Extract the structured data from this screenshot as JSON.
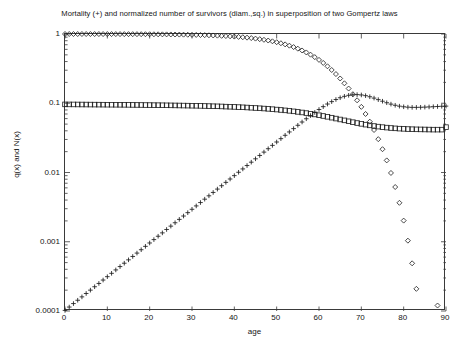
{
  "chart_data": {
    "type": "scatter",
    "title": "Mortality (+) and normalized number of survivors (diam.,sq.) in superposition of two Gompertz laws",
    "xlabel": "age",
    "ylabel": "q(x) and N(x)",
    "xlim": [
      0,
      90
    ],
    "ylim": [
      0.0001,
      1
    ],
    "yscale": "log",
    "xscale": "linear",
    "grid": false,
    "legend": "none",
    "xticks": [
      0,
      10,
      20,
      30,
      40,
      50,
      60,
      70,
      80,
      90
    ],
    "xtick_labels": [
      "0",
      "10",
      "20",
      "30",
      "40",
      "50",
      "60",
      "70",
      "80",
      "90"
    ],
    "yticks": [
      1,
      0.1,
      0.01,
      0.001,
      0.0001
    ],
    "ytick_labels": [
      "1",
      "0.1",
      "0.01",
      "0.001",
      "0.0001"
    ],
    "marker_color": "#1c1c1c",
    "frame_color": "#3a3a3a",
    "background": "#ffffff",
    "series": [
      {
        "name": "Mortality q(x)",
        "marker": "+",
        "marker_label": "plus",
        "x": [
          0,
          1,
          2,
          3,
          4,
          5,
          6,
          7,
          8,
          9,
          10,
          11,
          12,
          13,
          14,
          15,
          16,
          17,
          18,
          19,
          20,
          21,
          22,
          23,
          24,
          25,
          26,
          27,
          28,
          29,
          30,
          31,
          32,
          33,
          34,
          35,
          36,
          37,
          38,
          39,
          40,
          41,
          42,
          43,
          44,
          45,
          46,
          47,
          48,
          49,
          50,
          51,
          52,
          53,
          54,
          55,
          56,
          57,
          58,
          59,
          60,
          61,
          62,
          63,
          64,
          65,
          66,
          67,
          68,
          69,
          70,
          71,
          72,
          73,
          74,
          75,
          76,
          77,
          78,
          79,
          80,
          81,
          82,
          83,
          84,
          85,
          86,
          87,
          88,
          89,
          90
        ],
        "y": [
          0.000102,
          0.000114,
          0.000128,
          0.000143,
          0.00016,
          0.000179,
          0.0002,
          0.000224,
          0.00025,
          0.00028,
          0.000313,
          0.00035,
          0.000392,
          0.000438,
          0.00049,
          0.000548,
          0.000613,
          0.000686,
          0.000767,
          0.000858,
          0.00096,
          0.001074,
          0.001201,
          0.001343,
          0.001503,
          0.001681,
          0.00188,
          0.002103,
          0.002352,
          0.002631,
          0.002943,
          0.003292,
          0.003682,
          0.004118,
          0.004606,
          0.005151,
          0.00576,
          0.006442,
          0.007204,
          0.008057,
          0.009011,
          0.010077,
          0.011269,
          0.012602,
          0.014093,
          0.01576,
          0.017624,
          0.019709,
          0.02204,
          0.024646,
          0.02756,
          0.030816,
          0.034452,
          0.038509,
          0.043028,
          0.048049,
          0.053607,
          0.059722,
          0.066398,
          0.073604,
          0.08127,
          0.089276,
          0.097439,
          0.105513,
          0.113188,
          0.120103,
          0.125879,
          0.13016,
          0.132662,
          0.13322,
          0.131834,
          0.128686,
          0.124135,
          0.118664,
          0.112795,
          0.107016,
          0.101718,
          0.097169,
          0.093508,
          0.090768,
          0.088887,
          0.087756,
          0.087228,
          0.087159,
          0.087414,
          0.087882,
          0.088471,
          0.089115,
          0.089762,
          0.090378,
          0.09094
        ]
      },
      {
        "name": "Normalized survivors N(x) (diamonds)",
        "marker": "diamond",
        "marker_label": "diamond",
        "x": [
          0,
          1,
          2,
          3,
          4,
          5,
          6,
          7,
          8,
          9,
          10,
          11,
          12,
          13,
          14,
          15,
          16,
          17,
          18,
          19,
          20,
          21,
          22,
          23,
          24,
          25,
          26,
          27,
          28,
          29,
          30,
          31,
          32,
          33,
          34,
          35,
          36,
          37,
          38,
          39,
          40,
          41,
          42,
          43,
          44,
          45,
          46,
          47,
          48,
          49,
          50,
          51,
          52,
          53,
          54,
          55,
          56,
          57,
          58,
          59,
          60,
          61,
          62,
          63,
          64,
          65,
          66,
          67,
          68,
          69,
          70,
          71,
          72,
          73,
          74,
          75,
          76,
          77,
          78,
          79,
          80,
          81,
          82,
          83,
          84,
          85,
          86,
          87,
          88
        ],
        "y": [
          1.0,
          0.9999,
          0.9998,
          0.9996,
          0.9995,
          0.9993,
          0.9991,
          0.9989,
          0.9986,
          0.9983,
          0.998,
          0.9977,
          0.9973,
          0.9968,
          0.9963,
          0.9957,
          0.9951,
          0.9944,
          0.9936,
          0.9928,
          0.9918,
          0.9907,
          0.9895,
          0.9882,
          0.9867,
          0.985,
          0.9831,
          0.981,
          0.9787,
          0.9761,
          0.9732,
          0.9699,
          0.9663,
          0.9623,
          0.9578,
          0.9528,
          0.9472,
          0.941,
          0.9341,
          0.9264,
          0.9178,
          0.9083,
          0.8977,
          0.8859,
          0.8728,
          0.8583,
          0.8423,
          0.8246,
          0.8052,
          0.7839,
          0.7607,
          0.7355,
          0.7082,
          0.6788,
          0.6474,
          0.6139,
          0.5786,
          0.5415,
          0.503,
          0.4633,
          0.4228,
          0.3821,
          0.3417,
          0.3021,
          0.264,
          0.2278,
          0.1941,
          0.1631,
          0.1351,
          0.1103,
          0.0887,
          0.07,
          0.0542,
          0.0411,
          0.0303,
          0.0217,
          0.01495,
          0.00985,
          0.00617,
          0.00365,
          0.00202,
          0.001037,
          0.000488,
          0.000209,
          8.06e-05,
          2.79e-05,
          8.6e-06,
          2.4e-06,
          0.00012
        ]
      },
      {
        "name": "Normalized survivors N(x) (squares)",
        "marker": "square",
        "marker_label": "square",
        "x": [
          0,
          1,
          2,
          3,
          4,
          5,
          6,
          7,
          8,
          9,
          10,
          11,
          12,
          13,
          14,
          15,
          16,
          17,
          18,
          19,
          20,
          21,
          22,
          23,
          24,
          25,
          26,
          27,
          28,
          29,
          30,
          31,
          32,
          33,
          34,
          35,
          36,
          37,
          38,
          39,
          40,
          41,
          42,
          43,
          44,
          45,
          46,
          47,
          48,
          49,
          50,
          51,
          52,
          53,
          54,
          55,
          56,
          57,
          58,
          59,
          60,
          61,
          62,
          63,
          64,
          65,
          66,
          67,
          68,
          69,
          70,
          71,
          72,
          73,
          74,
          75,
          76,
          77,
          78,
          79,
          80,
          81,
          82,
          83,
          84,
          85,
          86,
          87,
          88,
          89,
          90
        ],
        "y": [
          0.0963,
          0.0962,
          0.0961,
          0.096,
          0.0959,
          0.0958,
          0.0957,
          0.0956,
          0.0955,
          0.0954,
          0.0953,
          0.0952,
          0.0951,
          0.095,
          0.0949,
          0.0948,
          0.0946,
          0.0945,
          0.0944,
          0.0942,
          0.0941,
          0.0939,
          0.0938,
          0.0936,
          0.0934,
          0.0932,
          0.093,
          0.0928,
          0.0926,
          0.0924,
          0.0921,
          0.0919,
          0.0916,
          0.0913,
          0.091,
          0.0906,
          0.0903,
          0.0899,
          0.0894,
          0.089,
          0.0885,
          0.088,
          0.0874,
          0.0868,
          0.0861,
          0.0854,
          0.0847,
          0.0839,
          0.083,
          0.0821,
          0.0811,
          0.08,
          0.0789,
          0.0777,
          0.0764,
          0.075,
          0.0736,
          0.0721,
          0.0705,
          0.0689,
          0.0672,
          0.0655,
          0.0637,
          0.0619,
          0.0601,
          0.0583,
          0.0566,
          0.0549,
          0.0533,
          0.0518,
          0.0504,
          0.0491,
          0.0479,
          0.0469,
          0.046,
          0.0452,
          0.0445,
          0.0439,
          0.0434,
          0.043,
          0.0427,
          0.0424,
          0.0422,
          0.042,
          0.0419,
          0.0418,
          0.0417,
          0.0416,
          0.0416,
          0.0416,
          0.0452
        ]
      }
    ]
  }
}
